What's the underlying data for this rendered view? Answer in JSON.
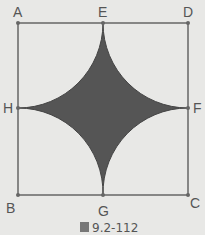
{
  "figure": {
    "caption": "圖 9.2-112",
    "caption_icon": "圖",
    "caption_number": "9.2-112",
    "points": {
      "A": "A",
      "B": "B",
      "C": "C",
      "D": "D",
      "E": "E",
      "F": "F",
      "G": "G",
      "H": "H"
    },
    "colors": {
      "background": "#e8e8e6",
      "square_stroke": "#666666",
      "shaded_region": "#555555"
    }
  }
}
